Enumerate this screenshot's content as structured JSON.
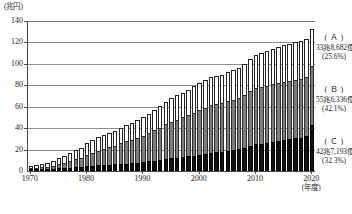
{
  "chart_data": {
    "type": "bar",
    "subtype": "stacked",
    "title": "",
    "xlabel": "(年度)",
    "ylabel": "",
    "unit_label": "(兆円)",
    "ylim": [
      0,
      140
    ],
    "yticks": [
      0,
      20,
      40,
      60,
      80,
      100,
      120,
      140
    ],
    "ytick_labels": [
      "0",
      "20",
      "40",
      "60",
      "80",
      "100",
      "120",
      "140"
    ],
    "grid": true,
    "grid_axis": "y",
    "legend_position": "right",
    "x": [
      1970,
      1971,
      1972,
      1973,
      1974,
      1975,
      1976,
      1977,
      1978,
      1979,
      1980,
      1981,
      1982,
      1983,
      1984,
      1985,
      1986,
      1987,
      1988,
      1989,
      1990,
      1991,
      1992,
      1993,
      1994,
      1995,
      1996,
      1997,
      1998,
      1999,
      2000,
      2001,
      2002,
      2003,
      2004,
      2005,
      2006,
      2007,
      2008,
      2009,
      2010,
      2011,
      2012,
      2013,
      2014,
      2015,
      2016,
      2017,
      2018,
      2019,
      2020
    ],
    "xtick_labels": [
      "1970",
      "1980",
      "1990",
      "2000",
      "2010",
      "2020"
    ],
    "xticks": [
      1970,
      1980,
      1990,
      2000,
      2010,
      2020
    ],
    "series": [
      {
        "name": "C",
        "key": "(C)",
        "color": "#111111",
        "values": [
          0.6,
          0.7,
          0.9,
          1.2,
          1.8,
          2.4,
          2.8,
          3.2,
          3.8,
          4.2,
          4.6,
          5.0,
          5.3,
          5.6,
          5.9,
          6.2,
          6.6,
          7.0,
          7.4,
          7.8,
          8.3,
          8.9,
          9.6,
          10.2,
          11.0,
          11.8,
          12.4,
          12.9,
          13.6,
          14.4,
          15.2,
          16.3,
          17.0,
          17.4,
          18.0,
          18.9,
          19.5,
          20.2,
          21.3,
          23.4,
          24.8,
          25.6,
          26.4,
          27.2,
          28.0,
          28.9,
          29.6,
          30.4,
          31.2,
          32.4,
          42.7
        ]
      },
      {
        "name": "B",
        "key": "(B)",
        "color": "#7d7d7d",
        "values": [
          0.9,
          1.1,
          1.5,
          2.0,
          2.9,
          3.9,
          4.8,
          5.8,
          7.0,
          8.1,
          10.5,
          12.2,
          13.8,
          15.1,
          16.4,
          17.6,
          19.2,
          20.6,
          21.8,
          23.1,
          24.7,
          26.4,
          28.4,
          30.4,
          32.5,
          34.1,
          35.6,
          37.1,
          38.9,
          40.2,
          41.7,
          42.8,
          44.6,
          45.2,
          45.8,
          46.8,
          47.2,
          48.2,
          49.6,
          51.7,
          52.4,
          52.9,
          53.3,
          53.6,
          53.8,
          54.1,
          54.4,
          54.8,
          55.0,
          55.3,
          55.6
        ]
      },
      {
        "name": "A",
        "key": "(A)",
        "color": "#ffffff",
        "values": [
          2.1,
          2.4,
          2.9,
          3.6,
          4.9,
          5.9,
          6.8,
          7.6,
          8.6,
          9.3,
          10.9,
          11.6,
          12.2,
          12.6,
          12.9,
          13.4,
          14.2,
          15.2,
          15.7,
          16.3,
          17.3,
          18.1,
          19.2,
          20.1,
          21.1,
          22.1,
          22.9,
          22.9,
          23.4,
          24.5,
          25.4,
          26.0,
          25.8,
          25.8,
          26.2,
          26.8,
          27.2,
          28.0,
          28.8,
          29.8,
          30.9,
          31.8,
          32.5,
          33.1,
          33.6,
          34.2,
          34.4,
          34.9,
          35.2,
          35.7,
          33.9
        ]
      }
    ],
    "annotations": [
      {
        "id": "A",
        "key": "(A)",
        "value": "33兆8,682億円",
        "pct": "(25.6%)"
      },
      {
        "id": "B",
        "key": "(B)",
        "value": "55兆6,336億円",
        "pct": "(42.1%)"
      },
      {
        "id": "C",
        "key": "(C)",
        "value": "42兆7,193億円",
        "pct": "(32.3%)"
      }
    ]
  },
  "axis": {
    "unit_label": "(兆円)",
    "x_unit_label": "(年度)"
  },
  "legend": {
    "a": {
      "key": "( Ａ )",
      "value": "33兆8,682億円",
      "pct": "(25.6%)"
    },
    "b": {
      "key": "( Ｂ )",
      "value": "55兆6,336億円",
      "pct": "(42.1%)"
    },
    "c": {
      "key": "( Ｃ )",
      "value": "42兆7,193億円",
      "pct": "(32.3%)"
    }
  }
}
